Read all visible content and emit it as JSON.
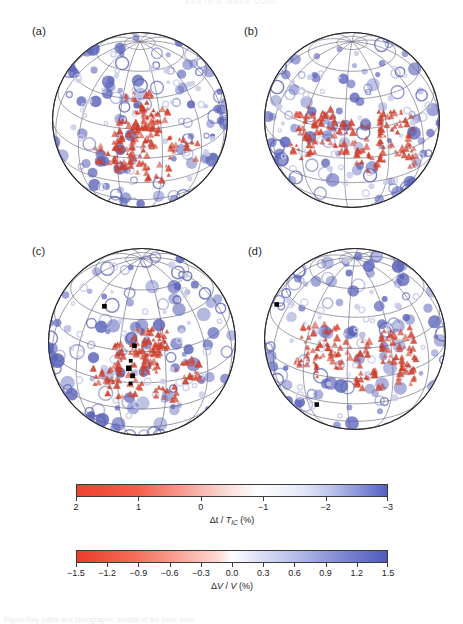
{
  "figure": {
    "running_head": "EARTH'S INNER CORE",
    "caption": "Figure  Ray paths and tomographic models of the inner core.",
    "panels": [
      {
        "id": "a",
        "label": "(a)"
      },
      {
        "id": "b",
        "label": "(b)"
      },
      {
        "id": "c",
        "label": "(c)"
      },
      {
        "id": "d",
        "label": "(d)"
      }
    ]
  },
  "chart_data": {
    "type": "heatmap",
    "projection": "orthographic",
    "grid": true,
    "graticule": {
      "meridian_step_deg": 30,
      "parallel_step_deg": 20
    },
    "legend_position": "bottom",
    "colorbars": [
      {
        "id": "dt-tic",
        "title": "Δt / T_IC (%)",
        "title_parts": {
          "pre": "Δt / ",
          "italic": "T",
          "sub": "IC",
          "post": " (%)"
        },
        "vmin": 2,
        "vmax": -3,
        "reversed": true,
        "discrete": true,
        "ticks": [
          2,
          1,
          0,
          -1,
          -2,
          -3
        ],
        "tick_labels": [
          "2",
          "1",
          "0",
          "−1",
          "−2",
          "−3"
        ],
        "stops": [
          {
            "pos": 0.0,
            "color": "#f04332"
          },
          {
            "pos": 0.1,
            "color": "#f2503c"
          },
          {
            "pos": 0.2,
            "color": "#f4604c"
          },
          {
            "pos": 0.3,
            "color": "#f58b7c"
          },
          {
            "pos": 0.4,
            "color": "#f8b7ae"
          },
          {
            "pos": 0.5,
            "color": "#fbe2de"
          },
          {
            "pos": 0.58,
            "color": "#fdfdfd"
          },
          {
            "pos": 0.66,
            "color": "#f2f3fb"
          },
          {
            "pos": 0.74,
            "color": "#dfe3f6"
          },
          {
            "pos": 0.82,
            "color": "#bcc4ec"
          },
          {
            "pos": 0.9,
            "color": "#8d99dc"
          },
          {
            "pos": 1.0,
            "color": "#5560c0"
          }
        ]
      },
      {
        "id": "dv-v",
        "title": "ΔV / V (%)",
        "title_parts": {
          "pre": "Δ",
          "italic": "V",
          "mid": " / ",
          "italic2": "V",
          "post": " (%)"
        },
        "vmin": -1.5,
        "vmax": 1.5,
        "reversed": false,
        "discrete": false,
        "ticks": [
          -1.5,
          -1.2,
          -0.9,
          -0.6,
          -0.3,
          0.0,
          0.3,
          0.6,
          0.9,
          1.2,
          1.5
        ],
        "tick_labels": [
          "−1.5",
          "−1.2",
          "−0.9",
          "−0.6",
          "−0.3",
          "0.0",
          "0.3",
          "0.6",
          "0.9",
          "1.2",
          "1.5"
        ],
        "stops": [
          {
            "pos": 0.0,
            "color": "#ee3b2c"
          },
          {
            "pos": 0.18,
            "color": "#f46a57"
          },
          {
            "pos": 0.34,
            "color": "#f9a99c"
          },
          {
            "pos": 0.46,
            "color": "#fcdcd7"
          },
          {
            "pos": 0.5,
            "color": "#ffffff"
          },
          {
            "pos": 0.56,
            "color": "#e6e9f8"
          },
          {
            "pos": 0.7,
            "color": "#b7bfe9"
          },
          {
            "pos": 0.85,
            "color": "#8089d2"
          },
          {
            "pos": 1.0,
            "color": "#4f5cbd"
          }
        ]
      }
    ],
    "markers": {
      "station_circle": {
        "name": "station",
        "color": "#5b63b8",
        "shape": "circle"
      },
      "source_triangle": {
        "name": "earthquake-source",
        "color": "#d9412f",
        "shape": "triangle"
      },
      "reference_square": {
        "name": "reference-point",
        "color": "#000000",
        "shape": "square"
      }
    },
    "anomaly_fields": {
      "a": {
        "pattern": "smooth-degree-2",
        "amplitude_pct": 1.2
      },
      "b": {
        "pattern": "smooth-strong-red-band",
        "amplitude_pct": 1.5
      },
      "c": {
        "pattern": "smooth-alternating-bands",
        "amplitude_pct": 1.4
      },
      "d": {
        "pattern": "blocky-checkerboard",
        "amplitude_pct": 1.5
      }
    }
  },
  "colors": {
    "red": "#ee3b2c",
    "blue": "#4f5cbd",
    "outline": "#2b2b2b",
    "graticule": "#6e6e82",
    "background": "#ffffff"
  }
}
